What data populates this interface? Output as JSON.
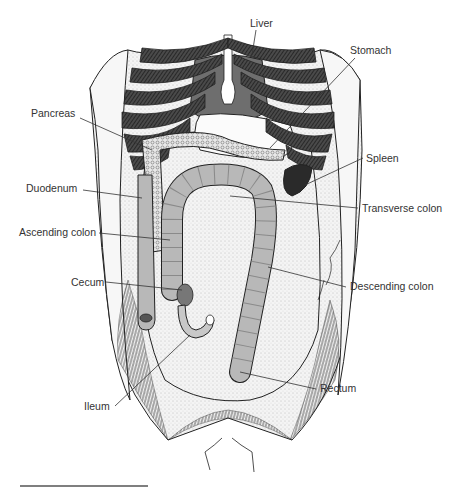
{
  "figure": {
    "colors": {
      "background": "#ffffff",
      "ink": "#222222",
      "label": "#333333",
      "colon_fill": "#b8b8b8",
      "liver_fill": "#6e6e6e",
      "rib_dark": "#3a3a3a",
      "stipple": "#e6e6e6"
    },
    "labels": [
      {
        "id": "liver",
        "text": "Liver",
        "x": 250,
        "y": 27
      },
      {
        "id": "stomach",
        "text": "Stomach",
        "x": 350,
        "y": 54
      },
      {
        "id": "pancreas",
        "text": "Pancreas",
        "x": 31,
        "y": 117
      },
      {
        "id": "spleen",
        "text": "Spleen",
        "x": 366,
        "y": 162
      },
      {
        "id": "duodenum",
        "text": "Duodenum",
        "x": 26,
        "y": 192
      },
      {
        "id": "transverse_colon",
        "text": "Transverse colon",
        "x": 362,
        "y": 212
      },
      {
        "id": "ascending_colon",
        "text": "Ascending colon",
        "x": 19,
        "y": 236
      },
      {
        "id": "cecum",
        "text": "Cecum",
        "x": 71,
        "y": 286
      },
      {
        "id": "descending_colon",
        "text": "Descending colon",
        "x": 350,
        "y": 290
      },
      {
        "id": "rectum",
        "text": "Rectum",
        "x": 320,
        "y": 392
      },
      {
        "id": "ileum",
        "text": "Ileum",
        "x": 84,
        "y": 410
      }
    ]
  }
}
